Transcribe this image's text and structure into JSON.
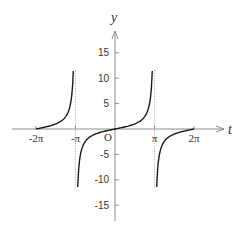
{
  "chart_data": {
    "type": "line",
    "title": "",
    "function": "y = tan(t/2)",
    "xlabel": "t",
    "ylabel": "y",
    "origin_label": "O",
    "x_ticks": [
      {
        "value": -6.2832,
        "label": "-2π"
      },
      {
        "value": -3.1416,
        "label": "-π"
      },
      {
        "value": 3.1416,
        "label": "π"
      },
      {
        "value": 6.2832,
        "label": "2π"
      }
    ],
    "y_ticks": [
      {
        "value": 15,
        "label": "15"
      },
      {
        "value": 10,
        "label": "10"
      },
      {
        "value": 5,
        "label": "5"
      },
      {
        "value": -5,
        "label": "-5"
      },
      {
        "value": -10,
        "label": "-10"
      },
      {
        "value": -15,
        "label": "-15"
      }
    ],
    "vertical_asymptotes": [
      -3.1416,
      3.1416
    ],
    "ylim": [
      -18,
      19
    ],
    "xlim": [
      -7.3,
      7.5
    ],
    "grid": false,
    "legend": null,
    "series": [
      {
        "name": "branch-1",
        "x": [
          -6.2832,
          -5.5,
          -5.0,
          -4.5,
          -4.0,
          -3.6,
          -3.3161
        ],
        "y": [
          0,
          0.41,
          0.6,
          0.78,
          2.43,
          4.3,
          11.43
        ]
      },
      {
        "name": "branch-2",
        "x": [
          -2.967,
          -2.5,
          -2.0,
          -1.0,
          0,
          1.0,
          2.0,
          2.5,
          2.967
        ],
        "y": [
          -11.43,
          -3.01,
          -1.56,
          -0.55,
          0,
          0.55,
          1.56,
          3.01,
          11.43
        ]
      },
      {
        "name": "branch-3",
        "x": [
          3.3161,
          3.6,
          4.0,
          4.5,
          5.0,
          5.5,
          6.2832
        ],
        "y": [
          -11.43,
          -4.3,
          -2.43,
          -1.25,
          -0.78,
          -0.41,
          0
        ]
      }
    ]
  }
}
